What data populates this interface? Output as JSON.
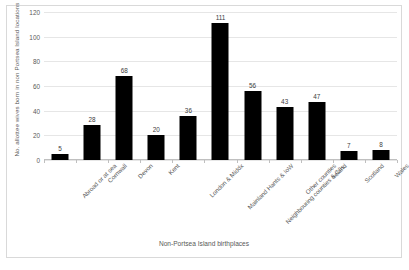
{
  "chart_data": {
    "type": "bar",
    "title": "",
    "xlabel": "Non-Portsea Island birthplaces",
    "ylabel": "No. allottee wives born in non Portsea Island locations",
    "categories": [
      "Abroad or at sea",
      "Cornwall",
      "Devon",
      "Kent",
      "London & Middx",
      "Mainland Hants & IoW",
      "Neighbouring counties & C/Is.",
      "Other counties",
      "Ireland",
      "Scotland",
      "Wales"
    ],
    "values": [
      5,
      28,
      68,
      20,
      36,
      111,
      56,
      43,
      47,
      7,
      8
    ],
    "data_labels": [
      "5",
      "28",
      "68",
      "20",
      "36",
      "111",
      "56",
      "43",
      "47",
      "7",
      "8"
    ],
    "ylim": [
      0,
      120
    ],
    "yticks": [
      0,
      20,
      40,
      60,
      80,
      100,
      120
    ],
    "ytick_labels": [
      "0",
      "20",
      "40",
      "60",
      "80",
      "100",
      "120"
    ],
    "grid": true,
    "legend": "none",
    "bar_color": "#000000",
    "gridline_color": "#E6E6E6",
    "text_color": "#595959"
  }
}
